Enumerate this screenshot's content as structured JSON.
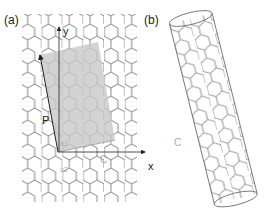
{
  "panels": [
    {
      "label": "(a)",
      "description": "graphene honeycomb lattice with chiral vector construction"
    },
    {
      "label": "(b)",
      "description": "rolled carbon nanotube"
    }
  ],
  "axes": {
    "x_label": "x",
    "y_label": "y"
  },
  "vectors": {
    "P": "P",
    "C": "C",
    "a1": "a1",
    "a2": "a2",
    "C_tube": "C"
  },
  "colors": {
    "lattice": "#666666",
    "shade": "#c8c8c8",
    "text": "#222222",
    "vector_gray": "#aaaaaa"
  }
}
